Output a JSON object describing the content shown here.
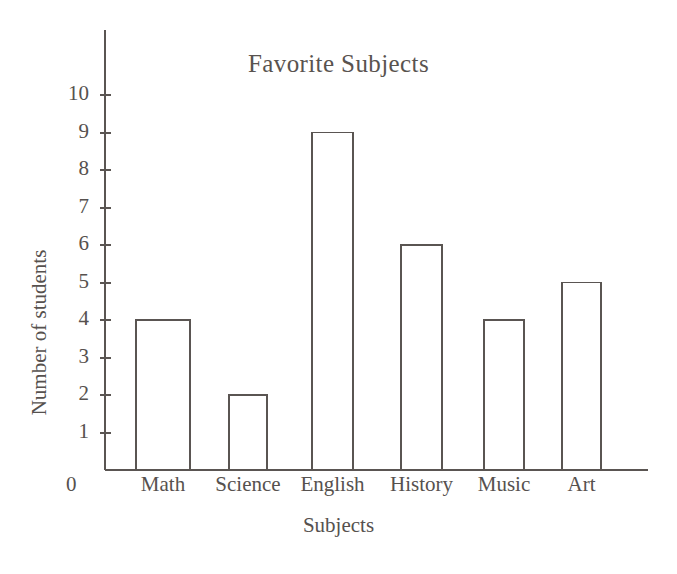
{
  "chart_data": {
    "type": "bar",
    "title": "Favorite Subjects",
    "xlabel": "Subjects",
    "ylabel": "Number of students",
    "categories": [
      "Math",
      "Science",
      "English",
      "History",
      "Music",
      "Art"
    ],
    "values": [
      4,
      2,
      9,
      6,
      4,
      5
    ],
    "ylim": [
      0,
      10
    ],
    "yticks": [
      1,
      2,
      3,
      4,
      5,
      6,
      7,
      8,
      9,
      10
    ],
    "ytick_labels": [
      "1",
      "2",
      "3",
      "4",
      "5",
      "6",
      "7",
      "8",
      "9",
      "10"
    ],
    "origin_label": "0",
    "grid": false,
    "legend": null,
    "bar_fill": "#ffffff",
    "bar_stroke": "#5a5552",
    "axis_color": "#5a5552",
    "text_color": "#56514e",
    "background": "#ffffff"
  },
  "axes": {
    "y_axis_x": 105,
    "baseline_y": 470,
    "unit_px": 37.5,
    "y_axis_top": 30,
    "x_axis_right": 648,
    "tick_len": 11
  },
  "bars": [
    {
      "label": "Math",
      "value": 4,
      "x": 136,
      "width": 54
    },
    {
      "label": "Science",
      "value": 2,
      "x": 229,
      "width": 38
    },
    {
      "label": "English",
      "value": 9,
      "x": 312,
      "width": 41
    },
    {
      "label": "History",
      "value": 6,
      "x": 401,
      "width": 41
    },
    {
      "label": "Music",
      "value": 4,
      "x": 484,
      "width": 40
    },
    {
      "label": "Art",
      "value": 5,
      "x": 562,
      "width": 39
    }
  ]
}
